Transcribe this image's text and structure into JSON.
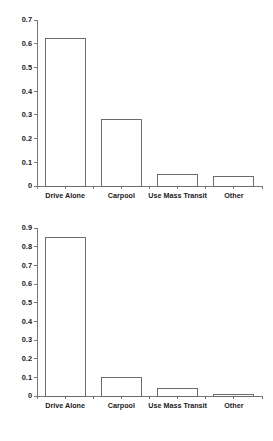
{
  "page": {
    "background_color": "#ffffff",
    "axis_color": "#777777",
    "bar_stroke_color": "#6b6b6b",
    "bar_fill_color": "#ffffff",
    "text_color": "#1a1a1a"
  },
  "chart_data": [
    {
      "type": "bar",
      "title": "",
      "subtitle": "",
      "xlabel": "",
      "ylabel": "",
      "categories": [
        "Drive Alone",
        "Carpool",
        "Use Mass Transit",
        "Other"
      ],
      "values": [
        0.62,
        0.28,
        0.05,
        0.04
      ],
      "ylim": [
        0,
        0.7
      ],
      "ytick_values": [
        0,
        0.1,
        0.2,
        0.3,
        0.4,
        0.5,
        0.6,
        0.7
      ],
      "ytick_labels": [
        "0",
        "0.1",
        "0.2",
        "0.3",
        "0.4",
        "0.5",
        "0.6",
        "0.7"
      ],
      "grid": false,
      "legend": false,
      "legend_position": "none",
      "annotations": []
    },
    {
      "type": "bar",
      "title": "",
      "subtitle": "",
      "xlabel": "",
      "ylabel": "",
      "categories": [
        "Drive Alone",
        "Carpool",
        "Use Mass Transit",
        "Other"
      ],
      "values": [
        0.85,
        0.1,
        0.04,
        0.01
      ],
      "ylim": [
        0,
        0.9
      ],
      "ytick_values": [
        0,
        0.1,
        0.2,
        0.3,
        0.4,
        0.5,
        0.6,
        0.7,
        0.8,
        0.9
      ],
      "ytick_labels": [
        "0",
        "0.1",
        "0.2",
        "0.3",
        "0.4",
        "0.5",
        "0.6",
        "0.7",
        "0.8",
        "0.9"
      ],
      "grid": false,
      "legend": false,
      "legend_position": "none",
      "annotations": []
    }
  ]
}
